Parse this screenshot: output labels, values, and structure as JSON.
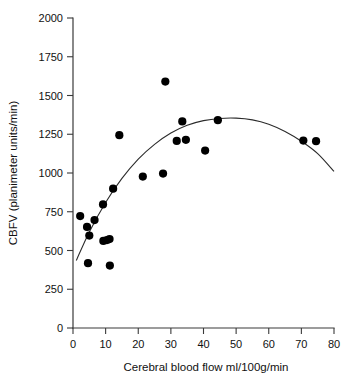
{
  "chart_data": {
    "type": "scatter",
    "title": "",
    "xlabel": "Cerebral blood flow ml/100g/min",
    "ylabel": "CBFV (planimeter units/min)",
    "xlim": [
      0,
      80
    ],
    "ylim": [
      0,
      2000
    ],
    "xticks": [
      0,
      10,
      20,
      30,
      40,
      50,
      60,
      70,
      80
    ],
    "yticks": [
      0,
      250,
      500,
      750,
      1000,
      1250,
      1500,
      1750,
      2000
    ],
    "xtick_labels": [
      "0",
      "10",
      "20",
      "30",
      "40",
      "50",
      "60",
      "70",
      "80"
    ],
    "ytick_labels": [
      "0",
      "250",
      "500",
      "750",
      "1000",
      "1250",
      "1500",
      "1750",
      "2000"
    ],
    "grid": false,
    "legend": false,
    "marker": "filled-circle",
    "marker_color": "#000000",
    "curve_color": "#2b2b2b",
    "points": [
      {
        "x": 2.2,
        "y": 722
      },
      {
        "x": 4.3,
        "y": 652
      },
      {
        "x": 4.6,
        "y": 418
      },
      {
        "x": 5.0,
        "y": 596
      },
      {
        "x": 6.6,
        "y": 696
      },
      {
        "x": 9.2,
        "y": 797
      },
      {
        "x": 9.3,
        "y": 562
      },
      {
        "x": 10.4,
        "y": 567
      },
      {
        "x": 11.2,
        "y": 574
      },
      {
        "x": 11.3,
        "y": 403
      },
      {
        "x": 12.3,
        "y": 899
      },
      {
        "x": 14.2,
        "y": 1244
      },
      {
        "x": 21.4,
        "y": 977
      },
      {
        "x": 27.6,
        "y": 996
      },
      {
        "x": 28.3,
        "y": 1590
      },
      {
        "x": 31.8,
        "y": 1207
      },
      {
        "x": 33.5,
        "y": 1333
      },
      {
        "x": 34.6,
        "y": 1214
      },
      {
        "x": 40.5,
        "y": 1145
      },
      {
        "x": 44.4,
        "y": 1341
      },
      {
        "x": 70.6,
        "y": 1209
      },
      {
        "x": 74.5,
        "y": 1205
      }
    ],
    "fit_curve": {
      "description": "quadratic-regression-curve",
      "points": [
        {
          "x": 1.0,
          "y": 435
        },
        {
          "x": 5.0,
          "y": 620
        },
        {
          "x": 10.0,
          "y": 810
        },
        {
          "x": 15.0,
          "y": 965
        },
        {
          "x": 20.0,
          "y": 1090
        },
        {
          "x": 25.0,
          "y": 1185
        },
        {
          "x": 30.0,
          "y": 1258
        },
        {
          "x": 35.0,
          "y": 1308
        },
        {
          "x": 40.0,
          "y": 1338
        },
        {
          "x": 45.0,
          "y": 1352
        },
        {
          "x": 50.0,
          "y": 1354
        },
        {
          "x": 55.0,
          "y": 1343
        },
        {
          "x": 60.0,
          "y": 1315
        },
        {
          "x": 65.0,
          "y": 1268
        },
        {
          "x": 70.0,
          "y": 1205
        },
        {
          "x": 75.0,
          "y": 1125
        },
        {
          "x": 80.0,
          "y": 1010
        }
      ]
    }
  }
}
